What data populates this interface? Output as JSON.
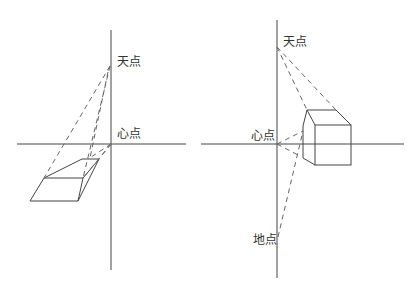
{
  "left_diagram": {
    "labels": {
      "sky_point": "天点",
      "center_point": "心点"
    }
  },
  "right_diagram": {
    "labels": {
      "sky_point": "天点",
      "center_point": "心点",
      "ground_point": "地点"
    }
  },
  "colors": {
    "line": "#444444",
    "dashed": "#666666",
    "background": "#ffffff"
  }
}
